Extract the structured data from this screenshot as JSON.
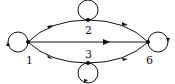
{
  "diagram": {
    "type": "directed-graph",
    "nodes": [
      {
        "id": "1",
        "label": "1",
        "x": 28,
        "y": 42,
        "label_x": 26,
        "label_y": 63,
        "self_loop": "left"
      },
      {
        "id": "2",
        "label": "2",
        "x": 88,
        "y": 20,
        "label_x": 85,
        "label_y": 33,
        "self_loop": "top"
      },
      {
        "id": "3",
        "label": "3",
        "x": 88,
        "y": 63,
        "label_x": 85,
        "label_y": 57,
        "self_loop": "bottom"
      },
      {
        "id": "6",
        "label": "6",
        "x": 148,
        "y": 42,
        "label_x": 146,
        "label_y": 63,
        "self_loop": "right"
      }
    ],
    "edges": [
      {
        "from": "1",
        "to": "2",
        "shape": "arc-upper"
      },
      {
        "from": "2",
        "to": "6",
        "shape": "arc-upper"
      },
      {
        "from": "1",
        "to": "6",
        "shape": "straight"
      },
      {
        "from": "1",
        "to": "3",
        "shape": "arc-lower"
      },
      {
        "from": "3",
        "to": "6",
        "shape": "arc-lower"
      },
      {
        "from": "1",
        "to": "1",
        "shape": "self-loop"
      },
      {
        "from": "2",
        "to": "2",
        "shape": "self-loop"
      },
      {
        "from": "3",
        "to": "3",
        "shape": "self-loop"
      },
      {
        "from": "6",
        "to": "6",
        "shape": "self-loop"
      }
    ],
    "colors": {
      "stroke": "#111111",
      "background": "#ffffff"
    }
  },
  "labels": {
    "n1": "1",
    "n2": "2",
    "n3": "3",
    "n6": "6"
  }
}
